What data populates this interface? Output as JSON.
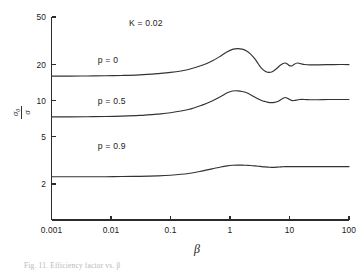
{
  "figure": {
    "background_color": "#ffffff",
    "line_color": "#333333",
    "axis_color": "#2b2b2b",
    "caption": "Fig. 11.  Efficiency factor vs. β"
  },
  "chart_data": {
    "type": "line",
    "title": "",
    "subtitle": "",
    "xlabel": "β",
    "ylabel_numerator": "σ₀",
    "ylabel_denominator": "σ",
    "ylabel": "σ₀/σ",
    "xscale": "log",
    "yscale": "log",
    "xlim": [
      0.001,
      100
    ],
    "ylim": [
      1.0,
      50
    ],
    "grid": false,
    "legend_position": "inline-annotations",
    "xticks": [
      0.001,
      0.01,
      0.1,
      1,
      10,
      100
    ],
    "xtick_labels": [
      "0.001",
      "0.01",
      "0.1",
      "1",
      "10",
      "100"
    ],
    "yticks": [
      2,
      5,
      10,
      20,
      50
    ],
    "ytick_labels": [
      "2",
      "5",
      "10",
      "20",
      "50"
    ],
    "annotations": [
      {
        "text": "K = 0.02",
        "x": 0.02,
        "y": 42
      },
      {
        "text": "p = 0",
        "x": 0.006,
        "y": 20.5
      },
      {
        "text": "p = 0.5",
        "x": 0.006,
        "y": 9.4
      },
      {
        "text": "p = 0.9",
        "x": 0.006,
        "y": 3.9
      }
    ],
    "series": [
      {
        "name": "p = 0",
        "label": "p = 0",
        "x": [
          0.001,
          0.002,
          0.004,
          0.008,
          0.015,
          0.03,
          0.06,
          0.1,
          0.2,
          0.35,
          0.5,
          0.7,
          0.9,
          1.1,
          1.35,
          1.6,
          1.9,
          2.2,
          2.6,
          3.0,
          3.4,
          3.9,
          4.4,
          5.0,
          5.6,
          6.3,
          7.0,
          7.8,
          8.5,
          9.2,
          10.0,
          11.0,
          12.0,
          13.5,
          15.0,
          18.0,
          22.0,
          30.0,
          45.0,
          70.0,
          100.0
        ],
        "y": [
          16.0,
          16.0,
          16.05,
          16.1,
          16.2,
          16.4,
          16.8,
          17.2,
          18.2,
          19.8,
          21.4,
          23.6,
          25.6,
          26.8,
          27.2,
          26.9,
          26.0,
          24.6,
          22.4,
          20.2,
          18.6,
          17.6,
          17.2,
          17.3,
          17.9,
          18.8,
          19.7,
          20.4,
          20.6,
          20.2,
          19.6,
          19.5,
          20.1,
          20.6,
          20.4,
          20.0,
          19.85,
          19.9,
          19.95,
          20.0,
          20.0
        ]
      },
      {
        "name": "p = 0.5",
        "label": "p = 0.5",
        "x": [
          0.001,
          0.002,
          0.004,
          0.008,
          0.015,
          0.03,
          0.06,
          0.1,
          0.2,
          0.35,
          0.5,
          0.7,
          0.9,
          1.1,
          1.35,
          1.6,
          1.9,
          2.2,
          2.6,
          3.0,
          3.4,
          3.9,
          4.4,
          5.0,
          5.6,
          6.3,
          7.0,
          7.8,
          8.5,
          9.2,
          10.0,
          11.0,
          12.0,
          13.5,
          15.0,
          18.0,
          22.0,
          30.0,
          45.0,
          70.0,
          100.0
        ],
        "y": [
          7.3,
          7.3,
          7.32,
          7.35,
          7.4,
          7.5,
          7.7,
          7.9,
          8.4,
          9.2,
          9.9,
          10.8,
          11.6,
          12.0,
          12.05,
          11.9,
          11.6,
          11.2,
          10.7,
          10.3,
          10.0,
          9.8,
          9.65,
          9.6,
          9.65,
          9.8,
          10.1,
          10.45,
          10.6,
          10.45,
          10.2,
          10.0,
          10.0,
          10.1,
          10.2,
          10.2,
          10.15,
          10.15,
          10.2,
          10.2,
          10.2
        ]
      },
      {
        "name": "p = 0.9",
        "label": "p = 0.9",
        "x": [
          0.001,
          0.002,
          0.004,
          0.008,
          0.015,
          0.03,
          0.06,
          0.1,
          0.2,
          0.35,
          0.5,
          0.7,
          0.9,
          1.1,
          1.35,
          1.6,
          1.9,
          2.2,
          2.6,
          3.0,
          3.4,
          3.9,
          4.4,
          5.0,
          5.6,
          6.3,
          7.0,
          7.8,
          8.5,
          9.2,
          10.0,
          11.0,
          12.0,
          13.5,
          15.0,
          18.0,
          22.0,
          30.0,
          45.0,
          70.0,
          100.0
        ],
        "y": [
          2.3,
          2.3,
          2.3,
          2.3,
          2.31,
          2.32,
          2.34,
          2.37,
          2.45,
          2.58,
          2.68,
          2.78,
          2.84,
          2.87,
          2.88,
          2.88,
          2.87,
          2.86,
          2.84,
          2.82,
          2.8,
          2.78,
          2.77,
          2.76,
          2.76,
          2.77,
          2.78,
          2.79,
          2.8,
          2.8,
          2.8,
          2.8,
          2.8,
          2.8,
          2.8,
          2.8,
          2.8,
          2.8,
          2.8,
          2.8,
          2.8
        ]
      }
    ]
  }
}
